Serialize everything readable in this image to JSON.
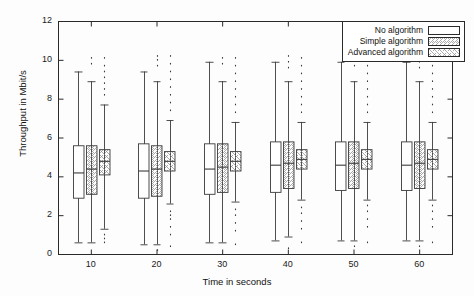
{
  "chart_data": {
    "type": "box",
    "title": "",
    "xlabel": "Time in seconds",
    "ylabel": "Throughput in Mbit/s",
    "categories": [
      "10",
      "20",
      "30",
      "40",
      "50",
      "60"
    ],
    "xtick_labels": [
      "10",
      "20",
      "30",
      "40",
      "50",
      "60"
    ],
    "ytick_labels": [
      "0",
      "2",
      "4",
      "6",
      "8",
      "10",
      "12"
    ],
    "yticks": [
      0,
      2,
      4,
      6,
      8,
      10,
      12
    ],
    "ylim": [
      0,
      12
    ],
    "grid": false,
    "legend_position": "top-right",
    "legend": [
      "No algorithm",
      "Simple algorithm",
      "Advanced algorithm"
    ],
    "series": [
      {
        "name": "No algorithm",
        "fill": "plain",
        "boxes": [
          {
            "category": "10",
            "whisker_low": 0.6,
            "q1": 2.9,
            "median": 4.2,
            "q3": 5.6,
            "whisker_high": 9.4,
            "outliers": []
          },
          {
            "category": "20",
            "whisker_low": 0.5,
            "q1": 2.9,
            "median": 4.3,
            "q3": 5.7,
            "whisker_high": 9.4,
            "outliers": []
          },
          {
            "category": "30",
            "whisker_low": 0.6,
            "q1": 3.1,
            "median": 4.4,
            "q3": 5.7,
            "whisker_high": 9.9,
            "outliers": []
          },
          {
            "category": "40",
            "whisker_low": 0.7,
            "q1": 3.2,
            "median": 4.6,
            "q3": 5.8,
            "whisker_high": 9.9,
            "outliers": []
          },
          {
            "category": "50",
            "whisker_low": 0.7,
            "q1": 3.3,
            "median": 4.6,
            "q3": 5.8,
            "whisker_high": 9.9,
            "outliers": []
          },
          {
            "category": "60",
            "whisker_low": 0.7,
            "q1": 3.3,
            "median": 4.6,
            "q3": 5.8,
            "whisker_high": 9.9,
            "outliers": []
          }
        ]
      },
      {
        "name": "Simple algorithm",
        "fill": "diagonal-hatch",
        "boxes": [
          {
            "category": "10",
            "whisker_low": 0.6,
            "q1": 3.1,
            "median": 4.4,
            "q3": 5.6,
            "whisker_high": 8.9,
            "outliers": [
              9.8,
              10.1
            ]
          },
          {
            "category": "20",
            "whisker_low": 0.5,
            "q1": 3.0,
            "median": 4.4,
            "q3": 5.6,
            "whisker_high": 8.9,
            "outliers": [
              0.2,
              9.7,
              10.0,
              10.2
            ]
          },
          {
            "category": "30",
            "whisker_low": 0.6,
            "q1": 3.2,
            "median": 4.5,
            "q3": 5.7,
            "whisker_high": 8.9,
            "outliers": [
              9.8,
              10.1
            ]
          },
          {
            "category": "40",
            "whisker_low": 0.9,
            "q1": 3.4,
            "median": 4.7,
            "q3": 5.8,
            "whisker_high": 8.9,
            "outliers": [
              0.3,
              9.6,
              9.9,
              10.2
            ]
          },
          {
            "category": "50",
            "whisker_low": 0.7,
            "q1": 3.4,
            "median": 4.7,
            "q3": 5.8,
            "whisker_high": 8.9,
            "outliers": [
              0.4,
              9.7,
              10.0,
              10.2
            ]
          },
          {
            "category": "60",
            "whisker_low": 0.7,
            "q1": 3.4,
            "median": 4.7,
            "q3": 5.8,
            "whisker_high": 8.9,
            "outliers": [
              0.4,
              9.6,
              9.9,
              10.2
            ]
          }
        ]
      },
      {
        "name": "Advanced algorithm",
        "fill": "cross-hatch",
        "boxes": [
          {
            "category": "10",
            "whisker_low": 1.3,
            "q1": 4.1,
            "median": 4.8,
            "q3": 5.4,
            "whisker_high": 7.7,
            "outliers": [
              0.6,
              0.8,
              1.0,
              8.2,
              8.5,
              8.8,
              9.1,
              9.4,
              9.7,
              10.1
            ]
          },
          {
            "category": "20",
            "whisker_low": 2.6,
            "q1": 4.3,
            "median": 4.8,
            "q3": 5.3,
            "whisker_high": 6.9,
            "outliers": [
              0.4,
              1.0,
              1.4,
              1.8,
              2.0,
              2.2,
              7.4,
              7.8,
              8.2,
              8.6,
              9.0,
              9.4,
              9.8,
              10.2
            ]
          },
          {
            "category": "30",
            "whisker_low": 2.7,
            "q1": 4.3,
            "median": 4.8,
            "q3": 5.3,
            "whisker_high": 6.8,
            "outliers": [
              0.5,
              1.2,
              1.6,
              2.0,
              2.3,
              7.3,
              7.7,
              8.1,
              8.5,
              8.9,
              9.3,
              9.7,
              10.1
            ]
          },
          {
            "category": "40",
            "whisker_low": 2.8,
            "q1": 4.4,
            "median": 4.9,
            "q3": 5.4,
            "whisker_high": 6.8,
            "outliers": [
              0.6,
              1.3,
              1.7,
              2.1,
              2.4,
              7.3,
              7.7,
              8.1,
              8.5,
              8.9,
              9.3,
              9.7,
              10.1
            ]
          },
          {
            "category": "50",
            "whisker_low": 2.8,
            "q1": 4.4,
            "median": 4.9,
            "q3": 5.4,
            "whisker_high": 6.8,
            "outliers": [
              0.6,
              1.4,
              1.8,
              2.2,
              2.5,
              7.3,
              7.7,
              8.1,
              8.5,
              8.9,
              9.3,
              9.7,
              10.1
            ]
          },
          {
            "category": "60",
            "whisker_low": 2.8,
            "q1": 4.4,
            "median": 4.9,
            "q3": 5.4,
            "whisker_high": 6.8,
            "outliers": [
              0.6,
              1.4,
              1.8,
              2.2,
              2.5,
              7.3,
              7.7,
              8.1,
              8.5,
              8.9,
              9.3,
              9.7,
              10.1
            ]
          }
        ]
      }
    ],
    "colors": {
      "axis": "#2a2a2a",
      "box_edge": "#3a3a3a",
      "box_fill": "#ffffff",
      "hatch": "#8a8a8a",
      "background": "#fdfdfd"
    }
  }
}
